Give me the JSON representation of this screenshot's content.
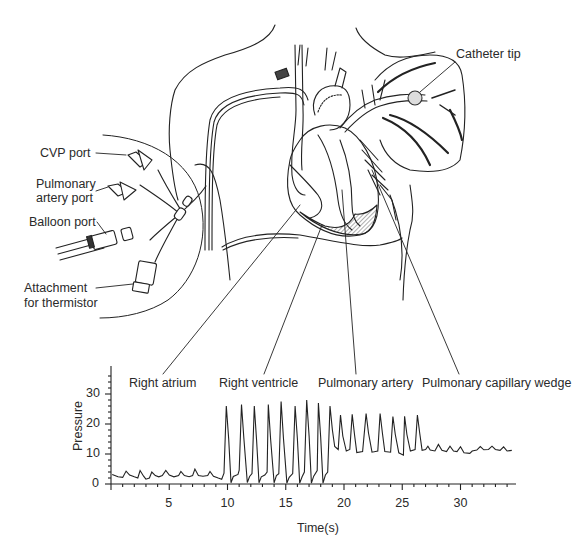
{
  "figure": {
    "type": "anatomical-diagram-with-pressure-waveform",
    "callouts": {
      "catheter_tip": "Catheter tip",
      "cvp_port": "CVP port",
      "pulmonary_artery_port_line1": "Pulmonary",
      "pulmonary_artery_port_line2": "artery port",
      "balloon_port": "Balloon port",
      "thermistor_line1": "Attachment",
      "thermistor_line2": "for thermistor"
    },
    "colors": {
      "ink": "#222222",
      "background": "#ffffff"
    }
  },
  "chart_data": {
    "type": "line",
    "title": "",
    "xlabel": "Time(s)",
    "ylabel": "Pressure",
    "xlim": [
      0,
      35
    ],
    "ylim": [
      0,
      38
    ],
    "x_ticks": [
      5,
      10,
      15,
      20,
      25,
      30
    ],
    "y_ticks": [
      0,
      10,
      20,
      30
    ],
    "grid": false,
    "legend": null,
    "annotations": [
      {
        "label": "Right atrium",
        "x_range": [
          0,
          8.7
        ]
      },
      {
        "label": "Right ventricle",
        "x_range": [
          8.7,
          17.2
        ]
      },
      {
        "label": "Pulmonary artery",
        "x_range": [
          17.2,
          25.6
        ]
      },
      {
        "label": "Pulmonary capillary wedge",
        "x_range": [
          25.6,
          34.5
        ]
      }
    ],
    "segments": [
      {
        "name": "Right atrium",
        "waveform": "low amplitude a/v waves",
        "baseline": 2,
        "peak": 4.5,
        "beats": 9,
        "range_mmHg": [
          1.5,
          5
        ]
      },
      {
        "name": "Right ventricle",
        "waveform": "tall systolic spikes",
        "baseline": 0,
        "peak": 26,
        "beats": 8,
        "range_mmHg": [
          0,
          28
        ]
      },
      {
        "name": "Pulmonary artery",
        "waveform": "systolic peaks with dicrotic notch",
        "baseline": 10,
        "peak": 23,
        "beats": 9,
        "range_mmHg": [
          9,
          25
        ]
      },
      {
        "name": "Pulmonary capillary wedge",
        "waveform": "low amplitude damped waves",
        "baseline": 11,
        "peak": 13,
        "beats": 8,
        "range_mmHg": [
          10,
          13
        ]
      }
    ],
    "series": [
      {
        "name": "Pressure",
        "points": [
          [
            0.1,
            3.2
          ],
          [
            0.6,
            2.4
          ],
          [
            1.0,
            2.2
          ],
          [
            1.3,
            4.3
          ],
          [
            1.6,
            3.0
          ],
          [
            2.0,
            2.4
          ],
          [
            2.3,
            2.0
          ],
          [
            2.5,
            4.5
          ],
          [
            2.8,
            2.6
          ],
          [
            3.0,
            1.6
          ],
          [
            3.3,
            2.0
          ],
          [
            3.5,
            4.0
          ],
          [
            3.8,
            2.8
          ],
          [
            4.1,
            2.4
          ],
          [
            4.4,
            2.8
          ],
          [
            4.7,
            4.5
          ],
          [
            5.0,
            3.0
          ],
          [
            5.4,
            2.4
          ],
          [
            5.8,
            2.8
          ],
          [
            6.0,
            4.2
          ],
          [
            6.3,
            2.8
          ],
          [
            6.7,
            2.4
          ],
          [
            7.0,
            2.8
          ],
          [
            7.2,
            5.0
          ],
          [
            7.5,
            2.8
          ],
          [
            7.9,
            2.6
          ],
          [
            8.3,
            2.8
          ],
          [
            8.5,
            4.2
          ],
          [
            8.8,
            2.6
          ],
          [
            9.2,
            2.0
          ],
          [
            9.5,
            1.6
          ],
          [
            9.7,
            3.6
          ],
          [
            9.9,
            26.0
          ],
          [
            10.1,
            15.0
          ],
          [
            10.3,
            0.4
          ],
          [
            10.5,
            2.5
          ],
          [
            10.9,
            3.2
          ],
          [
            11.0,
            4.6
          ],
          [
            11.2,
            26.5
          ],
          [
            11.4,
            15.5
          ],
          [
            11.7,
            0.5
          ],
          [
            11.9,
            2.5
          ],
          [
            12.1,
            3.5
          ],
          [
            12.3,
            26.0
          ],
          [
            12.5,
            14.5
          ],
          [
            12.7,
            0.4
          ],
          [
            12.9,
            2.4
          ],
          [
            13.2,
            3.0
          ],
          [
            13.4,
            4.0
          ],
          [
            13.5,
            26.5
          ],
          [
            13.7,
            15.0
          ],
          [
            14.0,
            0.4
          ],
          [
            14.2,
            2.8
          ],
          [
            14.4,
            3.4
          ],
          [
            14.6,
            27.5
          ],
          [
            14.8,
            15.5
          ],
          [
            15.1,
            0.3
          ],
          [
            15.3,
            2.2
          ],
          [
            15.6,
            3.5
          ],
          [
            15.8,
            26.0
          ],
          [
            16.0,
            15.0
          ],
          [
            16.2,
            0.3
          ],
          [
            16.4,
            2.4
          ],
          [
            16.6,
            4.0
          ],
          [
            16.8,
            28.0
          ],
          [
            17.0,
            16.0
          ],
          [
            17.2,
            0.3
          ],
          [
            17.4,
            2.6
          ],
          [
            17.7,
            4.5
          ],
          [
            17.8,
            27.0
          ],
          [
            18.0,
            15.5
          ],
          [
            18.2,
            0.3
          ],
          [
            18.4,
            3.0
          ],
          [
            18.6,
            4.0
          ],
          [
            18.8,
            26.0
          ],
          [
            19.0,
            18.0
          ],
          [
            19.2,
            12.5
          ],
          [
            19.5,
            11.5
          ],
          [
            19.7,
            23.0
          ],
          [
            19.9,
            16.0
          ],
          [
            20.2,
            11.0
          ],
          [
            20.5,
            11.5
          ],
          [
            20.7,
            23.2
          ],
          [
            20.9,
            16.5
          ],
          [
            21.1,
            10.5
          ],
          [
            21.6,
            10.8
          ],
          [
            21.9,
            23.5
          ],
          [
            22.1,
            17.0
          ],
          [
            22.4,
            10.6
          ],
          [
            22.9,
            11.0
          ],
          [
            23.1,
            23.5
          ],
          [
            23.3,
            17.0
          ],
          [
            23.5,
            10.8
          ],
          [
            24.0,
            10.6
          ],
          [
            24.2,
            22.5
          ],
          [
            24.4,
            16.5
          ],
          [
            24.7,
            10.4
          ],
          [
            25.1,
            9.6
          ],
          [
            25.2,
            22.6
          ],
          [
            25.4,
            16.5
          ],
          [
            25.7,
            11.0
          ],
          [
            26.1,
            11.5
          ],
          [
            26.3,
            23.0
          ],
          [
            26.5,
            17.0
          ],
          [
            26.7,
            11.2
          ],
          [
            27.0,
            11.5
          ],
          [
            27.2,
            12.6
          ],
          [
            27.4,
            11.3
          ],
          [
            27.8,
            11.0
          ],
          [
            28.1,
            13.2
          ],
          [
            28.4,
            11.2
          ],
          [
            28.8,
            10.8
          ],
          [
            29.1,
            12.6
          ],
          [
            29.4,
            11.0
          ],
          [
            29.7,
            10.8
          ],
          [
            30.0,
            12.4
          ],
          [
            30.3,
            10.4
          ],
          [
            30.8,
            10.2
          ],
          [
            31.0,
            11.0
          ],
          [
            31.4,
            11.3
          ],
          [
            31.7,
            12.5
          ],
          [
            32.0,
            11.4
          ],
          [
            32.4,
            11.5
          ],
          [
            32.7,
            12.6
          ],
          [
            33.0,
            11.5
          ],
          [
            33.4,
            11.2
          ],
          [
            33.7,
            12.4
          ],
          [
            34.0,
            11.0
          ],
          [
            34.4,
            11.2
          ]
        ]
      }
    ]
  }
}
